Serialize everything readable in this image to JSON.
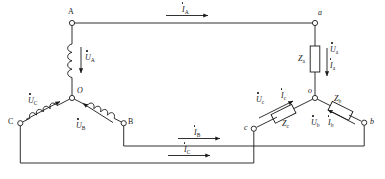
{
  "diagram": {
    "stroke_color": "#1a1a1a",
    "background_color": "#ffffff"
  },
  "source": {
    "name": "three-phase-wye-source",
    "neutral_label": "O",
    "terminals": [
      {
        "id": "A",
        "label": "A"
      },
      {
        "id": "B",
        "label": "B"
      },
      {
        "id": "C",
        "label": "C"
      }
    ],
    "phase_voltages": [
      {
        "id": "UA",
        "symbol": "U",
        "subscript": "A"
      },
      {
        "id": "UB",
        "symbol": "U",
        "subscript": "B"
      },
      {
        "id": "UC",
        "symbol": "U",
        "subscript": "C"
      }
    ]
  },
  "load": {
    "name": "three-phase-wye-load",
    "neutral_label": "o",
    "terminals": [
      {
        "id": "a",
        "label": "a"
      },
      {
        "id": "b",
        "label": "b"
      },
      {
        "id": "c",
        "label": "c"
      }
    ],
    "impedances": [
      {
        "id": "Za",
        "symbol": "Z",
        "subscript": "a"
      },
      {
        "id": "Zb",
        "symbol": "Z",
        "subscript": "b"
      },
      {
        "id": "Zc",
        "symbol": "Z",
        "subscript": "c"
      }
    ],
    "phase_voltages": [
      {
        "id": "Ua",
        "symbol": "U",
        "subscript": "a"
      },
      {
        "id": "Ub",
        "symbol": "U",
        "subscript": "b"
      },
      {
        "id": "Uc",
        "symbol": "U",
        "subscript": "c"
      }
    ],
    "phase_currents": [
      {
        "id": "Ia",
        "symbol": "I",
        "subscript": "a"
      },
      {
        "id": "Ib",
        "symbol": "I",
        "subscript": "b"
      },
      {
        "id": "Ic",
        "symbol": "I",
        "subscript": "c"
      }
    ]
  },
  "line_currents": [
    {
      "id": "IA",
      "symbol": "I",
      "subscript": "A"
    },
    {
      "id": "IB",
      "symbol": "I",
      "subscript": "B"
    },
    {
      "id": "IC",
      "symbol": "I",
      "subscript": "C"
    }
  ]
}
